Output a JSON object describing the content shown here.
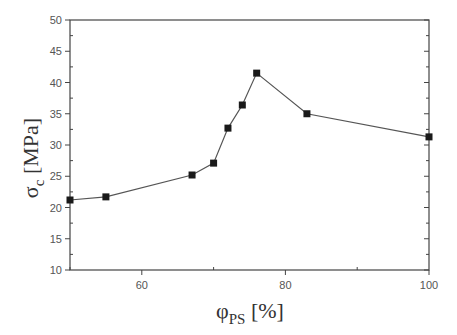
{
  "chart_data": {
    "type": "line",
    "title": "",
    "xlabel": "φPS [%]",
    "ylabel": "σc [MPa]",
    "xlabel_main": "φ",
    "xlabel_sub": "PS",
    "xlabel_unit": " [%]",
    "ylabel_main": "σ",
    "ylabel_sub": "c",
    "ylabel_unit": " [MPa]",
    "xlim": [
      50,
      100
    ],
    "ylim": [
      10,
      50
    ],
    "xticks": [
      60,
      80,
      100
    ],
    "yticks": [
      10,
      15,
      20,
      25,
      30,
      35,
      40,
      45,
      50
    ],
    "grid": false,
    "legend": null,
    "marker": "square",
    "series": [
      {
        "name": "σc",
        "x": [
          50,
          55,
          67,
          70,
          72,
          74,
          76,
          83,
          100
        ],
        "values": [
          21.2,
          21.7,
          25.2,
          27.1,
          32.7,
          36.4,
          41.5,
          35.0,
          31.3
        ]
      }
    ]
  },
  "colors": {
    "axis": "#444444",
    "line": "#555555",
    "marker": "#1a1a1a",
    "tick_text": "#555555"
  }
}
